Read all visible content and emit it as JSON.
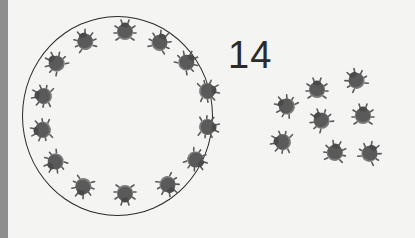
{
  "count_label": "14",
  "colors": {
    "background": "#f4f4f2",
    "bug_body": "#5a5a5a",
    "bug_shell": "#7a7a7a",
    "ring": "#2a2a2a",
    "left_bar": "#8e8e8e"
  },
  "ring_ladybugs": [
    {
      "x": 85,
      "y": 41,
      "r": -20
    },
    {
      "x": 125,
      "y": 31,
      "r": 0
    },
    {
      "x": 160,
      "y": 42,
      "r": 25
    },
    {
      "x": 187,
      "y": 62,
      "r": 45
    },
    {
      "x": 208,
      "y": 91,
      "r": 80
    },
    {
      "x": 208,
      "y": 127,
      "r": 95
    },
    {
      "x": 196,
      "y": 160,
      "r": 125
    },
    {
      "x": 168,
      "y": 185,
      "r": 150
    },
    {
      "x": 125,
      "y": 194,
      "r": 180
    },
    {
      "x": 83,
      "y": 187,
      "r": 200
    },
    {
      "x": 55,
      "y": 162,
      "r": 230
    },
    {
      "x": 42,
      "y": 130,
      "r": 260
    },
    {
      "x": 43,
      "y": 96,
      "r": 280
    },
    {
      "x": 56,
      "y": 63,
      "r": 315
    }
  ],
  "loose_ladybugs": [
    {
      "x": 317,
      "y": 89,
      "r": 0
    },
    {
      "x": 356,
      "y": 80,
      "r": -30
    },
    {
      "x": 286,
      "y": 106,
      "r": -60
    },
    {
      "x": 363,
      "y": 115,
      "r": 0
    },
    {
      "x": 321,
      "y": 120,
      "r": -40
    },
    {
      "x": 282,
      "y": 142,
      "r": -80
    },
    {
      "x": 335,
      "y": 152,
      "r": 10
    },
    {
      "x": 370,
      "y": 153,
      "r": 30
    }
  ]
}
